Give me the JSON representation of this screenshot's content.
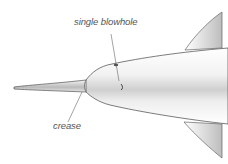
{
  "diagram": {
    "labels": [
      {
        "id": "blowhole",
        "text": "single blowhole"
      },
      {
        "id": "crease",
        "text": "crease"
      }
    ],
    "colors": {
      "outline": "#555555",
      "shading": "#9a9a9a",
      "label_text": "#555555",
      "leader_line": "#666666"
    }
  }
}
